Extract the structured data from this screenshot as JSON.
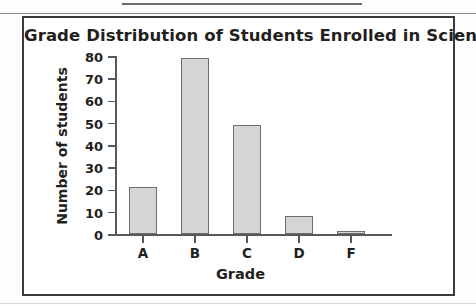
{
  "figure": {
    "title": "Grade Distribution of Students Enrolled in Science Class"
  },
  "chart_data": {
    "type": "bar",
    "title": "Grade Distribution of Students Enrolled in Science Class",
    "xlabel": "Grade",
    "ylabel": "Number of students",
    "categories": [
      "A",
      "B",
      "C",
      "D",
      "F"
    ],
    "values": [
      21,
      79,
      49,
      8,
      1
    ],
    "ylim": [
      0,
      80
    ],
    "yticks": [
      0,
      10,
      20,
      30,
      40,
      50,
      60,
      70,
      80
    ],
    "ytick_labels": [
      "0",
      "10",
      "20",
      "30",
      "40",
      "50",
      "60",
      "70",
      "80"
    ],
    "grid": false,
    "legend": null,
    "bar_fill": "#d5d5d5",
    "bar_edge": "#6d6d70"
  }
}
